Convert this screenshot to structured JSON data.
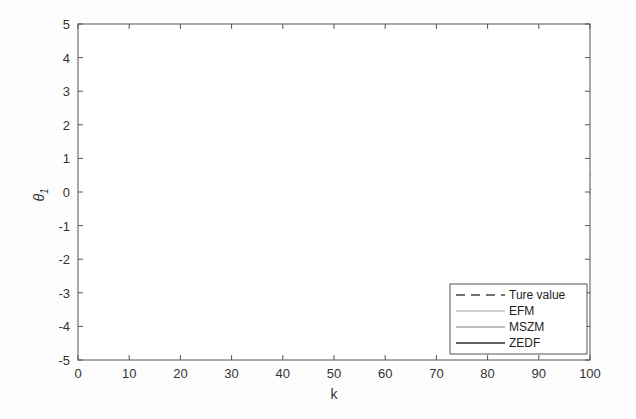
{
  "chart_data": {
    "type": "line",
    "title": "",
    "xlabel": "k",
    "ylabel": "θ1",
    "xlim": [
      0,
      100
    ],
    "ylim": [
      -5,
      5
    ],
    "xticks": [
      0,
      10,
      20,
      30,
      40,
      50,
      60,
      70,
      80,
      90,
      100
    ],
    "yticks": [
      -5,
      -4,
      -3,
      -2,
      -1,
      0,
      1,
      2,
      3,
      4,
      5
    ],
    "grid": false,
    "legend_position": "lower right",
    "legend": [
      "Ture value",
      "EFM",
      "MSZM",
      "ZEDF"
    ],
    "x": [
      2,
      4,
      6,
      8,
      10,
      12,
      14,
      16,
      18,
      20,
      22,
      24,
      26,
      28,
      30,
      32,
      34,
      36,
      38,
      40,
      42,
      44,
      46,
      48,
      50,
      52,
      54,
      56,
      58,
      60,
      62,
      64,
      66,
      68,
      70,
      72,
      74,
      76,
      78,
      80,
      82,
      84,
      86,
      88,
      90,
      92,
      94,
      96,
      98,
      100
    ],
    "series": [
      {
        "name": "Ture value",
        "style": "dashed",
        "color": "#444444",
        "values": [
          -0.25,
          -0.5,
          -0.74,
          -0.96,
          -1.18,
          -1.37,
          -1.54,
          -1.69,
          -1.81,
          -1.9,
          -1.96,
          -2.0,
          -2.0,
          -1.97,
          -1.9,
          -1.81,
          -1.69,
          -1.54,
          -1.37,
          -1.18,
          -0.96,
          -0.74,
          -0.5,
          -0.25,
          0.0,
          0.25,
          0.5,
          0.74,
          0.96,
          1.18,
          1.37,
          1.54,
          1.69,
          1.81,
          1.9,
          1.96,
          2.0,
          2.0,
          1.97,
          1.9,
          1.81,
          1.69,
          1.54,
          1.37,
          1.18,
          0.96,
          0.74,
          0.5,
          0.25,
          0.0
        ]
      },
      {
        "name": "EFM",
        "color": "#a8a8a8",
        "upper": [
          2.2,
          4.8,
          -0.3,
          0.9,
          -0.5,
          1.1,
          -0.6,
          0.7,
          -0.4,
          -0.1,
          -1.0,
          -0.2,
          -1.3,
          -0.4,
          -0.8,
          -0.3,
          -0.9,
          0.4,
          -1.0,
          0.3,
          -0.6,
          0.5,
          -0.3,
          0.9,
          0.2,
          1.1,
          0.3,
          1.9,
          0.9,
          2.4,
          1.6,
          2.8,
          1.6,
          3.2,
          2.0,
          3.3,
          2.6,
          3.5,
          2.8,
          3.8,
          2.5,
          3.4,
          2.2,
          3.4,
          1.9,
          2.0,
          1.7,
          2.5,
          1.6,
          1.3
        ],
        "lower": [
          -2.7,
          -5.0,
          -0.9,
          -2.6,
          -1.6,
          -2.9,
          -2.4,
          -3.1,
          -2.6,
          -3.5,
          -2.9,
          -3.4,
          -3.8,
          -3.5,
          -3.0,
          -3.9,
          -2.3,
          -3.0,
          -2.1,
          -2.9,
          -2.0,
          -2.7,
          -1.6,
          -1.2,
          -2.1,
          -0.8,
          -1.9,
          -0.3,
          -1.3,
          0.6,
          -0.7,
          0.8,
          -0.2,
          0.6,
          -0.3,
          1.0,
          0.4,
          0.6,
          -0.4,
          0.6,
          -0.2,
          0.6,
          -0.8,
          -0.7,
          -1.2,
          -0.8,
          -1.3,
          -1.1,
          -1.3,
          0.0
        ]
      },
      {
        "name": "MSZM",
        "color": "#7e7e7e",
        "upper": [
          2.2,
          4.3,
          -0.3,
          0.7,
          -0.6,
          0.6,
          -0.7,
          0.6,
          -0.6,
          -0.3,
          -1.2,
          -0.5,
          -1.4,
          -0.8,
          -1.1,
          -0.7,
          -1.1,
          -0.1,
          -1.1,
          -0.3,
          -0.7,
          0.1,
          -0.5,
          0.6,
          0.1,
          0.8,
          0.1,
          1.4,
          0.7,
          1.9,
          1.2,
          2.4,
          1.4,
          2.9,
          1.9,
          3.0,
          2.4,
          3.2,
          2.7,
          3.4,
          2.3,
          3.1,
          2.1,
          2.9,
          1.7,
          1.4,
          1.6,
          1.2,
          1.4,
          0.9
        ],
        "lower": [
          -2.7,
          -4.6,
          -0.9,
          -2.5,
          -1.4,
          -2.7,
          -2.2,
          -2.8,
          -2.3,
          -3.2,
          -2.6,
          -3.1,
          -3.3,
          -3.2,
          -2.8,
          -3.3,
          -2.1,
          -2.8,
          -1.9,
          -2.6,
          -1.8,
          -2.4,
          -1.4,
          -0.9,
          -1.8,
          -0.6,
          -1.4,
          -0.1,
          -0.9,
          0.7,
          -0.5,
          1.0,
          0.3,
          0.8,
          0.1,
          1.2,
          0.6,
          1.0,
          0.0,
          0.8,
          0.0,
          0.8,
          -0.5,
          -0.4,
          -0.9,
          -0.5,
          -1.0,
          -0.8,
          -1.0,
          0.0
        ]
      },
      {
        "name": "ZEDF",
        "color": "#2e2e2e",
        "upper": [
          2.1,
          4.0,
          -0.4,
          0.3,
          -0.7,
          0.3,
          -0.8,
          0.5,
          -0.9,
          -0.5,
          -1.4,
          -0.7,
          -1.6,
          -1.0,
          -1.3,
          -1.0,
          -1.3,
          -0.5,
          -1.3,
          -0.6,
          -0.9,
          -0.3,
          -0.7,
          0.3,
          0.0,
          0.4,
          -0.2,
          1.0,
          0.5,
          1.5,
          1.0,
          2.0,
          1.2,
          2.5,
          1.8,
          2.7,
          2.3,
          2.9,
          2.6,
          3.0,
          2.2,
          2.8,
          2.0,
          2.6,
          1.6,
          1.2,
          1.5,
          0.9,
          1.3,
          0.5
        ],
        "lower": [
          -2.7,
          -4.1,
          -0.8,
          -2.3,
          -1.2,
          -2.5,
          -1.9,
          -2.6,
          -2.0,
          -3.0,
          -2.4,
          -2.9,
          -2.9,
          -3.0,
          -2.6,
          -2.7,
          -2.0,
          -2.6,
          -1.8,
          -2.4,
          -1.6,
          -2.2,
          -1.3,
          -0.7,
          -1.6,
          -0.4,
          -1.1,
          0.1,
          -0.6,
          0.8,
          -0.3,
          1.1,
          0.6,
          1.0,
          0.4,
          1.3,
          0.8,
          1.2,
          0.4,
          1.0,
          0.2,
          1.0,
          -0.2,
          -0.1,
          -0.5,
          -0.2,
          -0.8,
          -0.5,
          -0.6,
          0.1
        ]
      }
    ]
  },
  "axes": {
    "xlabel": "k",
    "ylabel_main": "θ",
    "ylabel_sub": "1"
  },
  "legend": {
    "items": [
      {
        "label": "Ture value"
      },
      {
        "label": "EFM"
      },
      {
        "label": "MSZM"
      },
      {
        "label": "ZEDF"
      }
    ]
  }
}
